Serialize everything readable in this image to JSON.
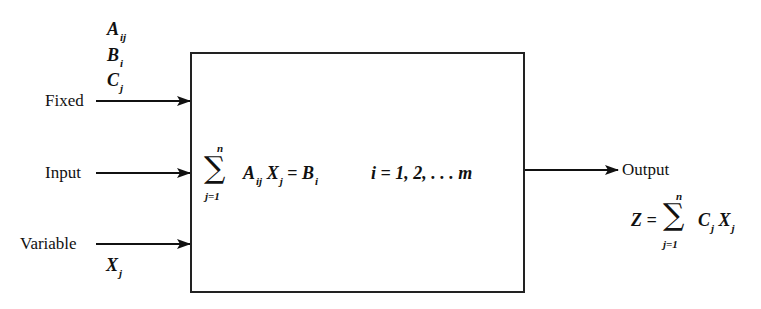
{
  "diagram": {
    "type": "block-diagram",
    "inputs": [
      {
        "label": "Fixed",
        "params": [
          "A",
          "B",
          "C"
        ],
        "param_subs": [
          "ij",
          "i",
          "j"
        ]
      },
      {
        "label": "Input"
      },
      {
        "label": "Variable",
        "param": "X",
        "param_sub": "j"
      }
    ],
    "box": {
      "sum_upper": "n",
      "sum_lower": "j=1",
      "sigma": "∑",
      "term1": "A",
      "term1_sub": "ij",
      "term2": "X",
      "term2_sub": "j",
      "equals": "=",
      "rhs": "B",
      "rhs_sub": "i",
      "index_range": "i = 1, 2, . . . m"
    },
    "output": {
      "label": "Output",
      "lhs": "Z =",
      "sum_upper": "n",
      "sum_lower": "j=1",
      "sigma": "∑",
      "term1": "C",
      "term1_sub": "j",
      "term2": "X",
      "term2_sub": "j"
    }
  }
}
